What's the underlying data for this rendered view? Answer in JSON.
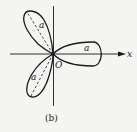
{
  "figure": {
    "caption": "(b)",
    "curve": "three-leaved rose",
    "axis_x_label": "x",
    "origin_label": "O",
    "petal_labels": [
      "a",
      "a",
      "a"
    ],
    "colors": {
      "stroke": "#1a1a1a",
      "background": "#f4f4f2"
    }
  }
}
